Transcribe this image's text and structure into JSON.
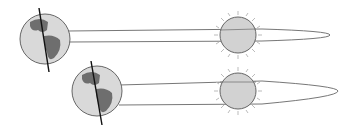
{
  "diagram": {
    "colors": {
      "earth_fill": "#d9d9d9",
      "land_fill": "#6e6e6e",
      "outline": "#555555",
      "orbit": "#666666",
      "sun_fill": "#d2d2d2",
      "rays": "#bbbbbb",
      "axis": "#111111"
    },
    "panels": [
      {
        "id": "top",
        "earth": "earth-with-tilted-axis",
        "sun": "sun",
        "orbit": "elongated-ellipse"
      },
      {
        "id": "bottom",
        "earth": "earth-with-tilted-axis",
        "sun": "sun",
        "orbit": "elongated-ellipse"
      }
    ]
  }
}
